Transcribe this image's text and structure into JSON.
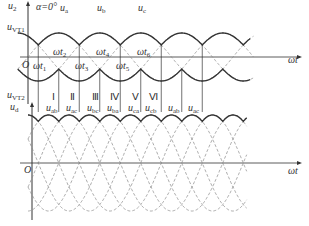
{
  "diagram": {
    "alpha_label": "α=0°",
    "top_plot": {
      "y_axis_label": {
        "main": "u",
        "sub": "2"
      },
      "vt1_label": {
        "main": "u",
        "sub": "VT1"
      },
      "origin_label": "O",
      "x_axis_label": "ωt",
      "phase_labels": [
        {
          "main": "u",
          "sub": "a"
        },
        {
          "main": "u",
          "sub": "b"
        },
        {
          "main": "u",
          "sub": "c"
        }
      ],
      "time_labels": [
        {
          "main": "ωt",
          "sub": "1"
        },
        {
          "main": "ωt",
          "sub": "2"
        },
        {
          "main": "ωt",
          "sub": "3"
        },
        {
          "main": "ωt",
          "sub": "4"
        },
        {
          "main": "ωt",
          "sub": "5"
        },
        {
          "main": "ωt",
          "sub": "6"
        }
      ],
      "vt2_label": {
        "main": "u",
        "sub": "VT2"
      }
    },
    "intervals": [
      "Ⅰ",
      "Ⅱ",
      "Ⅲ",
      "Ⅳ",
      "Ⅴ",
      "Ⅵ"
    ],
    "bottom_plot": {
      "y_axis_label": {
        "main": "u",
        "sub": "d"
      },
      "origin_label": "O",
      "x_axis_label": "ωt",
      "line_voltage_labels": [
        {
          "main": "u",
          "sub": "ab"
        },
        {
          "main": "u",
          "sub": "ac"
        },
        {
          "main": "u",
          "sub": "bc"
        },
        {
          "main": "u",
          "sub": "ba"
        },
        {
          "main": "u",
          "sub": "ca"
        },
        {
          "main": "u",
          "sub": "cb"
        },
        {
          "main": "u",
          "sub": "ab"
        },
        {
          "main": "u",
          "sub": "ac"
        }
      ]
    },
    "colors": {
      "line": "#333333",
      "dashed": "#888888",
      "background": "#ffffff"
    }
  }
}
